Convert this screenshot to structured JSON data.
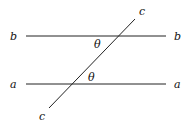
{
  "diagram": {
    "lines": {
      "b": {
        "label_left": "b",
        "label_right": "b"
      },
      "a": {
        "label_left": "a",
        "label_right": "a"
      },
      "c": {
        "label_top": "c",
        "label_bottom": "c"
      }
    },
    "angles": [
      {
        "label": "θ",
        "at": "intersection c-b"
      },
      {
        "label": "θ",
        "at": "intersection c-a"
      }
    ],
    "colors": {
      "stroke": "#222222",
      "text": "#111111"
    }
  }
}
